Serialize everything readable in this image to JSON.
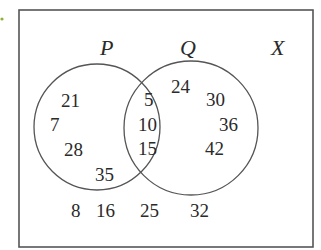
{
  "diagram": {
    "type": "venn",
    "universal_label": "X",
    "sets": [
      {
        "name": "P",
        "label": "P"
      },
      {
        "name": "Q",
        "label": "Q"
      }
    ],
    "regions": {
      "p_only": [
        "21",
        "7",
        "28",
        "35"
      ],
      "p_and_q": [
        "5",
        "10",
        "15"
      ],
      "q_only": [
        "24",
        "30",
        "36",
        "42"
      ],
      "outside": [
        "8",
        "16",
        "25",
        "32"
      ]
    },
    "colors": {
      "line": "#555555",
      "text": "#2a2a2a",
      "marker": "#8fb13a"
    }
  }
}
